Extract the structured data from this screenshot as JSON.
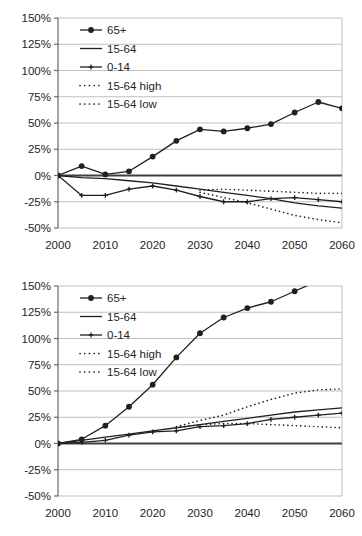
{
  "figure": {
    "panels": [
      "top",
      "bottom"
    ],
    "colors": {
      "ink": "#231f20",
      "gridline": "#bfbfbf",
      "zero_axis": "#404040",
      "frame": "#808080",
      "background": "#ffffff"
    }
  },
  "chart_data": [
    {
      "type": "line",
      "panel": "top",
      "title": "",
      "subtitle": "",
      "xlabel": "",
      "ylabel": "",
      "grid": true,
      "legend_position": "top-left",
      "x": [
        2000,
        2005,
        2010,
        2015,
        2020,
        2025,
        2030,
        2035,
        2040,
        2045,
        2050,
        2055,
        2060
      ],
      "xtick_labels": [
        "2000",
        "2010",
        "2020",
        "2030",
        "2040",
        "2050",
        "2060"
      ],
      "xticks": [
        2000,
        2010,
        2020,
        2030,
        2040,
        2050,
        2060
      ],
      "xlim": [
        2000,
        2060
      ],
      "ytick_labels": [
        "150%",
        "125%",
        "100%",
        "75%",
        "50%",
        "25%",
        "0%",
        "-25%",
        "-50%"
      ],
      "yticks": [
        150,
        125,
        100,
        75,
        50,
        25,
        0,
        -25,
        -50
      ],
      "ylim": [
        -50,
        150
      ],
      "series": [
        {
          "name": "65+",
          "marker": "circle",
          "style": "solid",
          "values": [
            0,
            9,
            1,
            4,
            18,
            33,
            44,
            42,
            45,
            49,
            60,
            70,
            64
          ]
        },
        {
          "name": "15-64",
          "marker": "none",
          "style": "solid",
          "values": [
            0,
            -2,
            -3,
            -5,
            -7,
            -10,
            -13,
            -16,
            -19,
            -22,
            -26,
            -29,
            -31
          ]
        },
        {
          "name": "0-14",
          "marker": "cross",
          "style": "solid",
          "values": [
            0,
            -19,
            -19,
            -13,
            -10,
            -14,
            -20,
            -25,
            -25,
            -22,
            -21,
            -23,
            -25
          ]
        },
        {
          "name": "15-64 high",
          "marker": "none",
          "style": "dotted",
          "values": [
            null,
            null,
            null,
            null,
            null,
            null,
            -14,
            -13,
            -14,
            -15,
            -16,
            -17,
            -17
          ]
        },
        {
          "name": "15-64 low",
          "marker": "none",
          "style": "dotted",
          "values": [
            null,
            null,
            null,
            null,
            null,
            null,
            -16,
            -21,
            -26,
            -32,
            -38,
            -42,
            -45
          ]
        }
      ]
    },
    {
      "type": "line",
      "panel": "bottom",
      "title": "",
      "subtitle": "",
      "xlabel": "",
      "ylabel": "",
      "grid": true,
      "legend_position": "top-left",
      "x": [
        2000,
        2005,
        2010,
        2015,
        2020,
        2025,
        2030,
        2035,
        2040,
        2045,
        2050,
        2055,
        2060
      ],
      "xtick_labels": [
        "2000",
        "2010",
        "2020",
        "2030",
        "2040",
        "2050",
        "2060"
      ],
      "xticks": [
        2000,
        2010,
        2020,
        2030,
        2040,
        2050,
        2060
      ],
      "xlim": [
        2000,
        2060
      ],
      "ytick_labels": [
        "150%",
        "125%",
        "100%",
        "75%",
        "50%",
        "25%",
        "0%",
        "-25%",
        "-50%"
      ],
      "yticks": [
        150,
        125,
        100,
        75,
        50,
        25,
        0,
        -25,
        -50
      ],
      "ylim": [
        -50,
        150
      ],
      "series": [
        {
          "name": "65+",
          "marker": "circle",
          "style": "solid",
          "values": [
            0,
            4,
            17,
            35,
            56,
            82,
            105,
            120,
            129,
            135,
            145,
            155,
            166
          ]
        },
        {
          "name": "15-64",
          "marker": "none",
          "style": "solid",
          "values": [
            0,
            3,
            6,
            9,
            12,
            15,
            18,
            21,
            24,
            27,
            30,
            32,
            34
          ]
        },
        {
          "name": "0-14",
          "marker": "cross",
          "style": "solid",
          "values": [
            0,
            1,
            3,
            8,
            11,
            12,
            16,
            17,
            19,
            23,
            25,
            27,
            29
          ]
        },
        {
          "name": "15-64 high",
          "marker": "none",
          "style": "dotted",
          "values": [
            null,
            null,
            null,
            null,
            null,
            16,
            22,
            27,
            35,
            42,
            48,
            51,
            52
          ]
        },
        {
          "name": "15-64 low",
          "marker": "none",
          "style": "dotted",
          "values": [
            null,
            null,
            null,
            null,
            null,
            15,
            18,
            19,
            19,
            18,
            17,
            16,
            15
          ]
        }
      ]
    }
  ],
  "legend": {
    "entries": [
      {
        "label": "65+",
        "marker": "circle",
        "style": "solid"
      },
      {
        "label": "15-64",
        "marker": "none",
        "style": "solid"
      },
      {
        "label": "0-14",
        "marker": "cross",
        "style": "solid"
      },
      {
        "label": "15-64 high",
        "marker": "none",
        "style": "dotted"
      },
      {
        "label": "15-64 low",
        "marker": "none",
        "style": "dotted"
      }
    ]
  }
}
